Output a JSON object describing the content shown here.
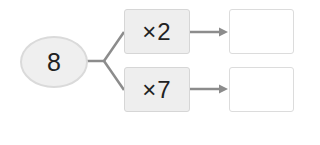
{
  "diagram": {
    "start_value": "8",
    "branches": [
      {
        "operation": "×2",
        "result": ""
      },
      {
        "operation": "×7",
        "result": ""
      }
    ]
  },
  "colors": {
    "ellipse_fill": "#efefef",
    "box_fill": "#eeeeee",
    "line": "#8c8c8c",
    "text": "#222222"
  }
}
